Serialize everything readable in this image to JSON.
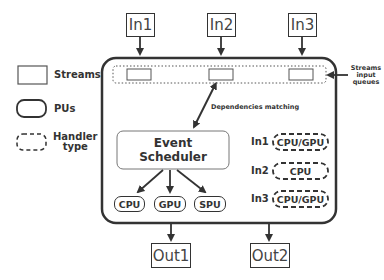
{
  "legend": {
    "items": [
      {
        "shape": "rectangle",
        "label": "Streams"
      },
      {
        "shape": "rounded-rectangle",
        "label": "PUs"
      },
      {
        "shape": "dashed-rounded-rectangle",
        "label_line1": "Handler",
        "label_line2": "type"
      }
    ]
  },
  "inputs": [
    "In1",
    "In2",
    "In3"
  ],
  "outputs": [
    "Out1",
    "Out2"
  ],
  "annotations": {
    "queues_line1": "Streams",
    "queues_line2": "input",
    "queues_line3": "queues",
    "dependencies": "Dependencies matching"
  },
  "scheduler": {
    "line1": "Event",
    "line2": "Scheduler"
  },
  "pus": [
    "CPU",
    "GPU",
    "SPU"
  ],
  "handlers": [
    {
      "stream": "In1",
      "type": "CPU/GPU"
    },
    {
      "stream": "In2",
      "type": "CPU"
    },
    {
      "stream": "In3",
      "type": "CPU/GPU"
    }
  ],
  "colors": {
    "stroke": "#333333",
    "background": "#ffffff"
  }
}
